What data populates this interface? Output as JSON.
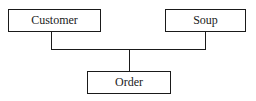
{
  "diagram": {
    "type": "tree",
    "nodes": [
      {
        "id": "customer",
        "label": "Customer"
      },
      {
        "id": "soup",
        "label": "Soup"
      },
      {
        "id": "order",
        "label": "Order"
      }
    ],
    "edges": [
      {
        "from": "customer",
        "to": "order"
      },
      {
        "from": "soup",
        "to": "order"
      }
    ]
  },
  "colors": {
    "stroke": "#1a1a1a",
    "background": "#ffffff"
  }
}
